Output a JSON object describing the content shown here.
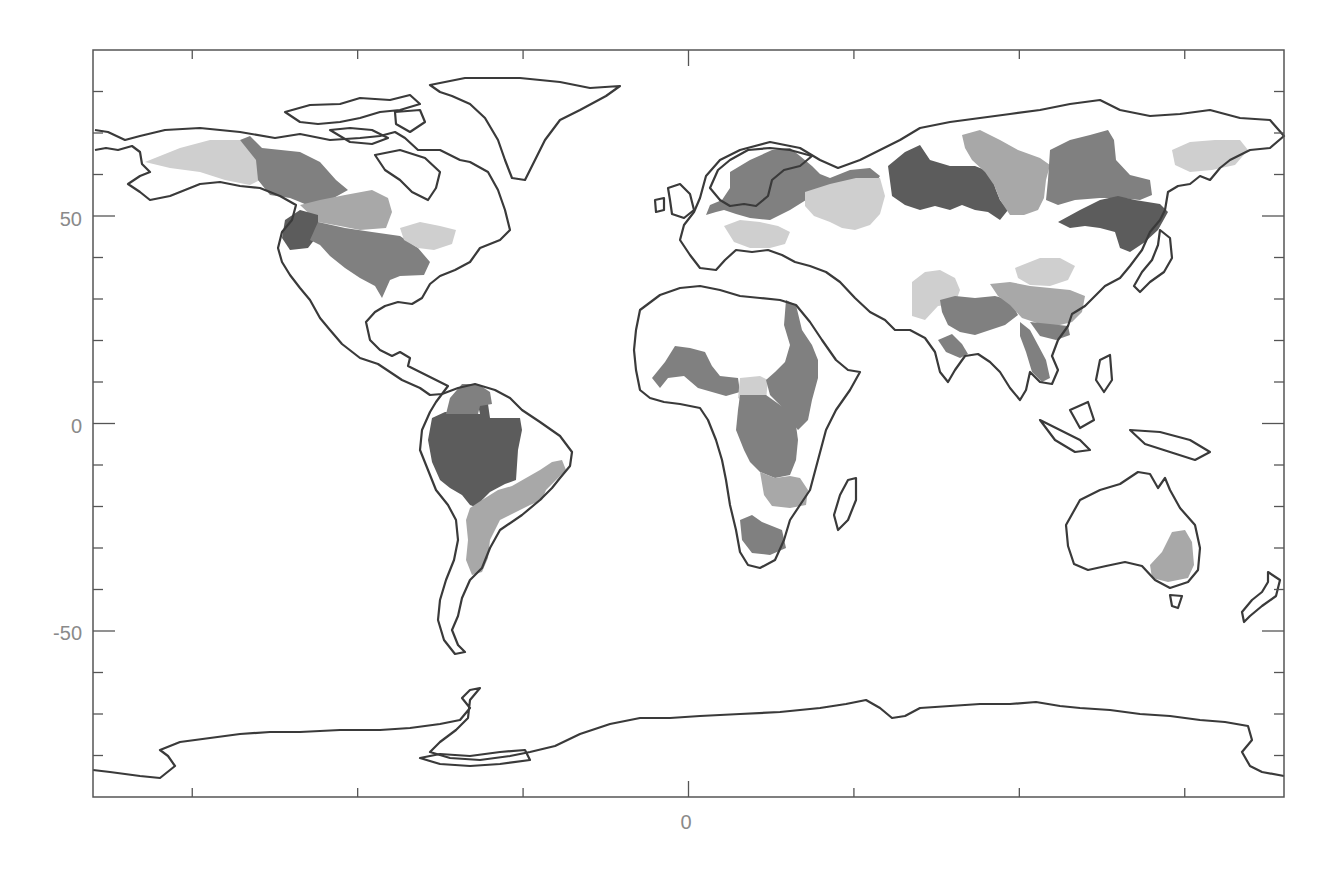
{
  "figure": {
    "type": "world-map",
    "projection": "equirectangular",
    "frame": {
      "left": 93,
      "top": 50,
      "right": 1284,
      "bottom": 797
    },
    "lon_range": [
      -180,
      180
    ],
    "lat_range": [
      -90,
      90
    ]
  },
  "axes": {
    "y": {
      "labels": [
        {
          "text": "50",
          "value": 50
        },
        {
          "text": "0",
          "value": 0
        },
        {
          "text": "-50",
          "value": -50
        }
      ],
      "minor_tick_step": 10
    },
    "x": {
      "labels": [
        {
          "text": "0",
          "value": 0
        }
      ],
      "major_tick_step": 50
    }
  },
  "colors": {
    "coast": "#3a3a3a",
    "frame": "#555555",
    "label": "#8a8a8a",
    "basin_dark": "#5c5c5c",
    "basin_mid": "#808080",
    "basin_light": "#a8a8a8",
    "basin_pale": "#cfcfcf"
  },
  "basins": [
    {
      "name": "Amazon",
      "shade": "basin_dark"
    },
    {
      "name": "Orinoco",
      "shade": "basin_mid"
    },
    {
      "name": "Parana",
      "shade": "basin_light"
    },
    {
      "name": "Sao Francisco",
      "shade": "basin_light"
    },
    {
      "name": "Mississippi",
      "shade": "basin_mid"
    },
    {
      "name": "Columbia",
      "shade": "basin_dark"
    },
    {
      "name": "Mackenzie",
      "shade": "basin_mid"
    },
    {
      "name": "Yukon",
      "shade": "basin_pale"
    },
    {
      "name": "Nelson",
      "shade": "basin_light"
    },
    {
      "name": "St. Lawrence",
      "shade": "basin_pale"
    },
    {
      "name": "Congo",
      "shade": "basin_mid"
    },
    {
      "name": "Nile",
      "shade": "basin_mid"
    },
    {
      "name": "Niger",
      "shade": "basin_mid"
    },
    {
      "name": "Lake Chad",
      "shade": "basin_pale"
    },
    {
      "name": "Zambezi",
      "shade": "basin_light"
    },
    {
      "name": "Orange",
      "shade": "basin_mid"
    },
    {
      "name": "Ob",
      "shade": "basin_dark"
    },
    {
      "name": "Yenisei",
      "shade": "basin_light"
    },
    {
      "name": "Lena",
      "shade": "basin_mid"
    },
    {
      "name": "Kolyma",
      "shade": "basin_pale"
    },
    {
      "name": "Amur",
      "shade": "basin_dark"
    },
    {
      "name": "Volga",
      "shade": "basin_pale"
    },
    {
      "name": "Northern Europe",
      "shade": "basin_mid"
    },
    {
      "name": "Danube",
      "shade": "basin_pale"
    },
    {
      "name": "Ganges-Brahmaputra",
      "shade": "basin_mid"
    },
    {
      "name": "Indus",
      "shade": "basin_pale"
    },
    {
      "name": "Yangtze",
      "shade": "basin_light"
    },
    {
      "name": "Huang He",
      "shade": "basin_pale"
    },
    {
      "name": "Mekong",
      "shade": "basin_mid"
    },
    {
      "name": "Murray-Darling",
      "shade": "basin_light"
    }
  ]
}
